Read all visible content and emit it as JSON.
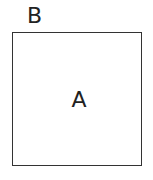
{
  "diagram": {
    "outer_label": "B",
    "box": {
      "inner_label": "A",
      "border_color": "#333333"
    }
  }
}
